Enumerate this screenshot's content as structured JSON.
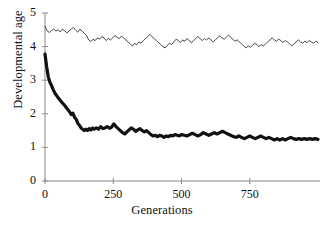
{
  "chart_data": {
    "type": "line",
    "title": "",
    "subtitle": "",
    "xlabel": "Generations",
    "ylabel": "Developmental age",
    "xlim": [
      0,
      1000
    ],
    "ylim": [
      0,
      5
    ],
    "xticks": [
      0,
      250,
      500,
      750
    ],
    "yticks": [
      0,
      1,
      2,
      3,
      4,
      5
    ],
    "xtick_labels": [
      "0",
      "250",
      "500",
      "750"
    ],
    "ytick_labels": [
      "0",
      "1",
      "2",
      "3",
      "4",
      "5"
    ],
    "grid": false,
    "legend": false,
    "legend_position": "none",
    "axis_color": "#8a8a8a",
    "series": [
      {
        "name": "upper-thin-line",
        "style": "thin",
        "color": "#1a1a1a",
        "linewidth": 0.8,
        "x": [
          0,
          8,
          16,
          24,
          32,
          40,
          48,
          56,
          64,
          72,
          80,
          88,
          96,
          104,
          112,
          120,
          128,
          136,
          144,
          152,
          160,
          168,
          176,
          184,
          192,
          200,
          208,
          216,
          224,
          232,
          240,
          248,
          256,
          264,
          272,
          280,
          288,
          296,
          304,
          312,
          320,
          328,
          336,
          344,
          352,
          360,
          368,
          376,
          384,
          392,
          400,
          408,
          416,
          424,
          432,
          440,
          448,
          456,
          464,
          472,
          480,
          488,
          496,
          504,
          512,
          520,
          528,
          536,
          544,
          552,
          560,
          568,
          576,
          584,
          592,
          600,
          608,
          616,
          624,
          632,
          640,
          648,
          656,
          664,
          672,
          680,
          688,
          696,
          704,
          712,
          720,
          728,
          736,
          744,
          752,
          760,
          768,
          776,
          784,
          792,
          800,
          808,
          816,
          824,
          832,
          840,
          848,
          856,
          864,
          872,
          880,
          888,
          896,
          904,
          912,
          920,
          928,
          936,
          944,
          952,
          960,
          968,
          976,
          984,
          992,
          1000
        ],
        "y": [
          4.6,
          4.47,
          4.42,
          4.48,
          4.52,
          4.46,
          4.5,
          4.44,
          4.52,
          4.47,
          4.41,
          4.46,
          4.52,
          4.57,
          4.49,
          4.43,
          4.52,
          4.46,
          4.4,
          4.33,
          4.2,
          4.15,
          4.22,
          4.18,
          4.26,
          4.22,
          4.3,
          4.26,
          4.18,
          4.24,
          4.2,
          4.26,
          4.33,
          4.28,
          4.24,
          4.31,
          4.26,
          4.2,
          4.14,
          4.08,
          4.02,
          4.1,
          4.06,
          4.14,
          4.1,
          4.18,
          4.24,
          4.3,
          4.36,
          4.3,
          4.24,
          4.18,
          4.12,
          4.06,
          4.0,
          3.96,
          4.04,
          4.1,
          4.06,
          4.14,
          4.22,
          4.18,
          4.12,
          4.2,
          4.16,
          4.24,
          4.18,
          4.12,
          4.18,
          4.24,
          4.3,
          4.24,
          4.18,
          4.24,
          4.2,
          4.26,
          4.2,
          4.14,
          4.2,
          4.26,
          4.32,
          4.26,
          4.22,
          4.28,
          4.34,
          4.28,
          4.22,
          4.16,
          4.2,
          4.14,
          4.08,
          4.02,
          3.96,
          4.02,
          3.98,
          4.04,
          4.1,
          4.06,
          4.0,
          4.06,
          4.02,
          4.08,
          4.14,
          4.2,
          4.26,
          4.2,
          4.16,
          4.22,
          4.18,
          4.12,
          4.18,
          4.14,
          4.08,
          4.02,
          4.08,
          4.14,
          4.2,
          4.14,
          4.1,
          4.16,
          4.12,
          4.18,
          4.14,
          4.1,
          4.16,
          4.12
        ]
      },
      {
        "name": "lower-thick-line",
        "style": "thick",
        "color": "#111111",
        "linewidth": 3.2,
        "x": [
          0,
          6,
          12,
          18,
          24,
          30,
          36,
          42,
          48,
          54,
          60,
          66,
          72,
          78,
          84,
          90,
          96,
          102,
          108,
          114,
          120,
          126,
          132,
          138,
          144,
          150,
          156,
          162,
          168,
          174,
          180,
          188,
          196,
          204,
          212,
          220,
          228,
          236,
          244,
          252,
          260,
          268,
          276,
          284,
          292,
          300,
          308,
          316,
          324,
          332,
          340,
          348,
          356,
          364,
          372,
          380,
          388,
          396,
          404,
          412,
          420,
          428,
          436,
          444,
          452,
          460,
          468,
          476,
          484,
          492,
          500,
          510,
          520,
          530,
          540,
          550,
          560,
          570,
          580,
          590,
          600,
          610,
          620,
          630,
          640,
          650,
          660,
          670,
          680,
          690,
          700,
          710,
          720,
          730,
          740,
          750,
          760,
          770,
          780,
          790,
          800,
          810,
          820,
          830,
          840,
          850,
          860,
          870,
          880,
          890,
          900,
          910,
          920,
          930,
          940,
          950,
          960,
          970,
          980,
          990,
          1000
        ],
        "y": [
          3.78,
          3.4,
          3.1,
          2.94,
          2.84,
          2.72,
          2.62,
          2.55,
          2.48,
          2.42,
          2.36,
          2.3,
          2.25,
          2.18,
          2.12,
          2.06,
          1.98,
          2.02,
          1.9,
          1.84,
          1.72,
          1.66,
          1.58,
          1.54,
          1.5,
          1.54,
          1.5,
          1.56,
          1.52,
          1.58,
          1.54,
          1.58,
          1.54,
          1.62,
          1.56,
          1.58,
          1.62,
          1.57,
          1.6,
          1.7,
          1.62,
          1.56,
          1.5,
          1.44,
          1.4,
          1.46,
          1.52,
          1.58,
          1.54,
          1.48,
          1.52,
          1.56,
          1.5,
          1.46,
          1.5,
          1.44,
          1.38,
          1.34,
          1.36,
          1.32,
          1.36,
          1.34,
          1.3,
          1.34,
          1.32,
          1.36,
          1.34,
          1.38,
          1.36,
          1.34,
          1.38,
          1.36,
          1.34,
          1.38,
          1.42,
          1.38,
          1.34,
          1.38,
          1.44,
          1.4,
          1.36,
          1.4,
          1.44,
          1.4,
          1.44,
          1.48,
          1.44,
          1.4,
          1.36,
          1.32,
          1.3,
          1.34,
          1.3,
          1.26,
          1.3,
          1.34,
          1.3,
          1.26,
          1.3,
          1.34,
          1.3,
          1.26,
          1.3,
          1.26,
          1.22,
          1.26,
          1.22,
          1.26,
          1.22,
          1.26,
          1.3,
          1.26,
          1.24,
          1.26,
          1.24,
          1.26,
          1.24,
          1.26,
          1.24,
          1.26,
          1.24
        ]
      }
    ]
  }
}
